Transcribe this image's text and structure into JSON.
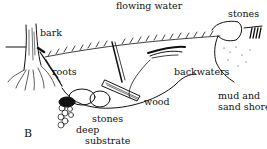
{
  "diagram": {
    "panel_letter": "B",
    "labels": {
      "flowing_water": "flowing water",
      "stones_top": "stones",
      "bark": "bark",
      "roots": "roots",
      "backwaters": "backwaters",
      "mud_line1": "mud and",
      "mud_line2": "sand shore",
      "wood": "wood",
      "stones_bottom": "stones",
      "deep": "deep",
      "substrate": "substrate"
    },
    "colors": {
      "ink": "#111111",
      "background": "#ffffff"
    }
  }
}
